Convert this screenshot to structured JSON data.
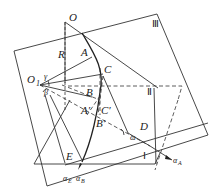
{
  "diagram": {
    "type": "geometric-projection",
    "points": {
      "O": "O",
      "O1": "O",
      "O1_sub": "1",
      "R": "R",
      "A": "A",
      "B": "B",
      "C": "C",
      "A_prime": "A′",
      "B_prime": "B′",
      "C_prime": "C′",
      "D": "D",
      "E": "E"
    },
    "angles": {
      "gamma": "γ",
      "beta": "β",
      "omega": "ω"
    },
    "planes": {
      "plane_1": "Ⅰ",
      "plane_2": "Ⅱ",
      "plane_3": "Ⅲ"
    },
    "rays": {
      "alpha_A": "α",
      "alpha_A_sub": "A",
      "alpha_E": "α",
      "alpha_E_sub": "E",
      "alpha_B": "α",
      "alpha_B_sub": "B"
    }
  }
}
